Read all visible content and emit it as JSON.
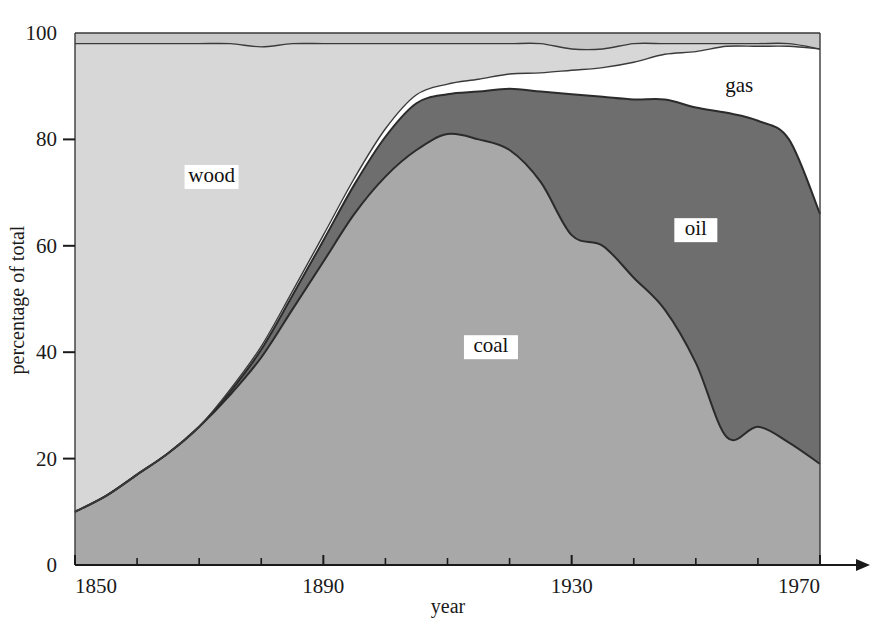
{
  "chart_data": {
    "type": "area",
    "stacked": true,
    "title": "",
    "xlabel": "year",
    "ylabel": "percentage of total",
    "xlim": [
      1850,
      1970
    ],
    "ylim": [
      0,
      100
    ],
    "grid": false,
    "legend_position": "inline-labels",
    "x_tick_labels": [
      "1850",
      "1890",
      "1930",
      "1970"
    ],
    "x_major_ticks": [
      1850,
      1890,
      1930,
      1970
    ],
    "x_minor_ticks": [
      1860,
      1870,
      1880,
      1900,
      1910,
      1920,
      1940,
      1950,
      1960
    ],
    "y_tick_labels": [
      "0",
      "20",
      "40",
      "60",
      "80",
      "100"
    ],
    "y_ticks": [
      0,
      20,
      40,
      60,
      80,
      100
    ],
    "x": [
      1850,
      1855,
      1860,
      1865,
      1870,
      1875,
      1880,
      1885,
      1890,
      1895,
      1900,
      1905,
      1910,
      1915,
      1920,
      1925,
      1930,
      1935,
      1940,
      1945,
      1950,
      1955,
      1960,
      1965,
      1970
    ],
    "series": [
      {
        "name": "coal",
        "label": "coal",
        "color": "#a8a8a8",
        "values": [
          10,
          13,
          17,
          21,
          26,
          32,
          39,
          48,
          57,
          66,
          73,
          78,
          81,
          80,
          78,
          72,
          62,
          60,
          54,
          48,
          38,
          24,
          26,
          23,
          19
        ]
      },
      {
        "name": "oil",
        "label": "oil",
        "color": "#6e6e6e",
        "values": [
          0,
          0,
          0,
          0,
          0,
          0.6,
          1.5,
          2.6,
          4.0,
          5.5,
          7.5,
          8.8,
          7.5,
          9.0,
          11.5,
          17,
          26.5,
          28,
          33.5,
          39.5,
          48,
          61,
          57.5,
          57,
          47
        ]
      },
      {
        "name": "gas",
        "label": "gas",
        "color": "#ffffff",
        "values": [
          0,
          0,
          0,
          0,
          0,
          0.4,
          0.6,
          0.8,
          1.0,
          1.2,
          1.5,
          1.6,
          1.9,
          2.3,
          2.8,
          3.5,
          4.5,
          5.5,
          7.0,
          8.5,
          10.5,
          12.5,
          14.0,
          17.5,
          31.0
        ]
      },
      {
        "name": "wood",
        "label": "wood",
        "color": "#d7d7d7",
        "values": [
          88,
          85,
          81,
          77,
          72,
          65,
          56.3,
          46.6,
          36,
          25.3,
          16,
          9.6,
          7.6,
          6.7,
          5.7,
          5.5,
          4.0,
          3.5,
          3.5,
          2.0,
          1.5,
          0.5,
          0.5,
          0.5,
          0.0
        ]
      },
      {
        "name": "other",
        "label": "",
        "color": "#c8c8c8",
        "values": [
          2,
          2,
          2,
          2,
          2,
          2,
          2.6,
          2,
          2,
          2,
          2,
          2,
          2,
          2,
          2,
          2,
          3,
          3,
          2,
          2,
          2,
          2,
          2,
          2,
          3
        ]
      }
    ],
    "annotations": [
      {
        "text": "wood",
        "x": 1872,
        "y": 72
      },
      {
        "text": "coal",
        "x": 1917,
        "y": 40
      },
      {
        "text": "oil",
        "x": 1950,
        "y": 62
      },
      {
        "text": "gas",
        "x": 1957,
        "y": 89
      }
    ]
  },
  "colors": {
    "wood": "#d7d7d7",
    "coal": "#a8a8a8",
    "oil": "#6e6e6e",
    "gas": "#ffffff",
    "other": "#c8c8c8",
    "axis": "#1a1a1a",
    "outline": "#2b2b2b",
    "background": "#ffffff"
  }
}
